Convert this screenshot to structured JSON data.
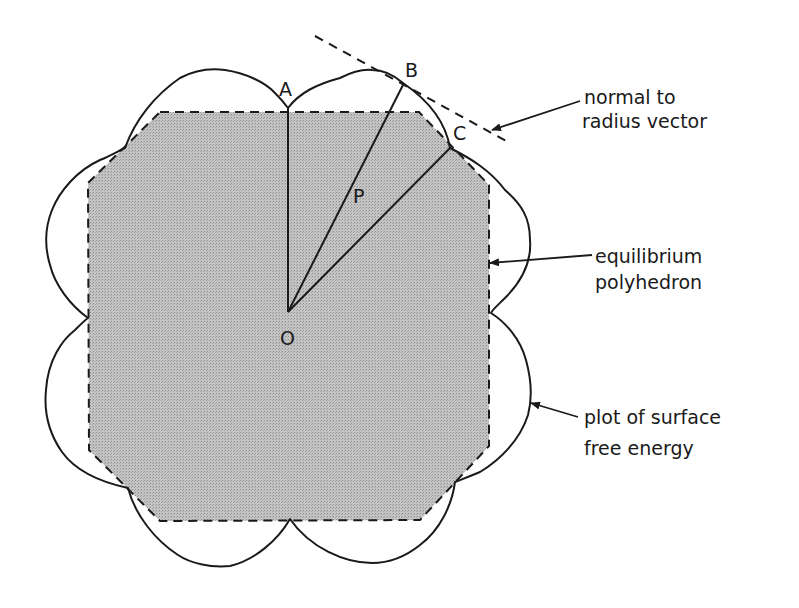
{
  "figure": {
    "points": {
      "A": "A",
      "B": "B",
      "C": "C",
      "P": "P",
      "O": "O"
    },
    "annotations": {
      "normal_line1": "normal to",
      "normal_line2": "radius vector",
      "polyhedron_line1": "equilibrium",
      "polyhedron_line2": "polyhedron",
      "energy_line1": "plot of surface",
      "energy_line2": "free energy"
    },
    "colors": {
      "fill": "#b9b9b9",
      "stroke": "#1a1a1a",
      "background": "#ffffff"
    }
  }
}
